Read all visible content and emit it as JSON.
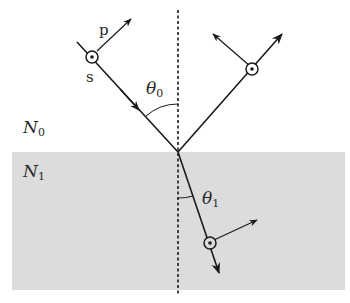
{
  "diagram": {
    "colors": {
      "background": "#ffffff",
      "medium1_fill": "#dcdcdc",
      "line": "#1a1a1a",
      "text": "#2a2a2a"
    },
    "labels": {
      "p": "p",
      "s": "s",
      "theta0": "θ",
      "theta0_sub": "0",
      "theta1": "θ",
      "theta1_sub": "1",
      "N0": "N",
      "N0_sub": "0",
      "N1": "N",
      "N1_sub": "1"
    },
    "rays": [
      {
        "name": "incident",
        "direction": "toward interface"
      },
      {
        "name": "reflected",
        "direction": "away from interface"
      },
      {
        "name": "transmitted",
        "direction": "into medium N1"
      }
    ]
  }
}
